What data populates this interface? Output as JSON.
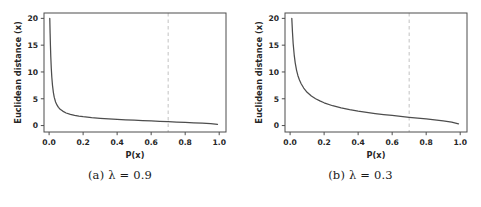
{
  "figure": {
    "panels": [
      {
        "id": "panel-a",
        "caption_index": "(a)",
        "caption_symbol": "λ",
        "caption_value": "= 0.9",
        "caption_full": "(a) λ = 0.9"
      },
      {
        "id": "panel-b",
        "caption_index": "(b)",
        "caption_symbol": "λ",
        "caption_value": "= 0.3",
        "caption_full": "(b) λ = 0.3"
      }
    ]
  },
  "colors": {
    "curve": "#4d4d4d",
    "axis": "#4d4d4d",
    "threshold_line": "#c8c8c8",
    "text": "#262626",
    "background": "#ffffff"
  },
  "chart_data": [
    {
      "type": "line",
      "id": "panel-a",
      "title": "",
      "xlabel": "P(x)",
      "ylabel": "Euclidean distance (x)",
      "xlim": [
        -0.03,
        1.04
      ],
      "ylim": [
        -1.2,
        21.0
      ],
      "xticks": [
        0.0,
        0.2,
        0.4,
        0.6,
        0.8,
        1.0
      ],
      "xticklabels": [
        "0.0",
        "0.2",
        "0.4",
        "0.6",
        "0.8",
        "1.0"
      ],
      "yticks": [
        0,
        5,
        10,
        15,
        20
      ],
      "yticklabels": [
        "0",
        "5",
        "10",
        "15",
        "20"
      ],
      "grid": false,
      "legend": null,
      "annotations": [
        {
          "type": "vline",
          "name": "threshold",
          "x": 0.7,
          "style": "dashed",
          "color": "#c8c8c8"
        }
      ],
      "series": [
        {
          "name": "lambda=0.9",
          "x": [
            0.004,
            0.006,
            0.008,
            0.01,
            0.013,
            0.016,
            0.02,
            0.025,
            0.03,
            0.038,
            0.046,
            0.055,
            0.065,
            0.08,
            0.1,
            0.125,
            0.15,
            0.175,
            0.2,
            0.25,
            0.3,
            0.35,
            0.4,
            0.45,
            0.5,
            0.55,
            0.6,
            0.65,
            0.7,
            0.75,
            0.8,
            0.85,
            0.9,
            0.95,
            0.99
          ],
          "y": [
            20.0,
            17.2,
            14.8,
            12.8,
            10.6,
            9.0,
            7.5,
            6.2,
            5.3,
            4.4,
            3.85,
            3.4,
            3.05,
            2.7,
            2.35,
            2.08,
            1.9,
            1.76,
            1.65,
            1.48,
            1.35,
            1.25,
            1.15,
            1.07,
            1.0,
            0.93,
            0.86,
            0.79,
            0.72,
            0.66,
            0.59,
            0.52,
            0.44,
            0.35,
            0.24
          ]
        }
      ]
    },
    {
      "type": "line",
      "id": "panel-b",
      "title": "",
      "xlabel": "P(x)",
      "ylabel": "Euclidean distance (x)",
      "xlim": [
        -0.03,
        1.04
      ],
      "ylim": [
        -1.2,
        21.0
      ],
      "xticks": [
        0.0,
        0.2,
        0.4,
        0.6,
        0.8,
        1.0
      ],
      "xticklabels": [
        "0.0",
        "0.2",
        "0.4",
        "0.6",
        "0.8",
        "1.0"
      ],
      "yticks": [
        0,
        5,
        10,
        15,
        20
      ],
      "yticklabels": [
        "0",
        "5",
        "10",
        "15",
        "20"
      ],
      "grid": false,
      "legend": null,
      "annotations": [
        {
          "type": "vline",
          "name": "threshold",
          "x": 0.7,
          "style": "dashed",
          "color": "#c8c8c8"
        }
      ],
      "series": [
        {
          "name": "lambda=0.3",
          "x": [
            0.01,
            0.014,
            0.018,
            0.024,
            0.03,
            0.038,
            0.046,
            0.055,
            0.065,
            0.08,
            0.1,
            0.125,
            0.15,
            0.175,
            0.2,
            0.25,
            0.3,
            0.35,
            0.4,
            0.45,
            0.5,
            0.55,
            0.6,
            0.65,
            0.7,
            0.75,
            0.8,
            0.85,
            0.9,
            0.95,
            0.99
          ],
          "y": [
            20.0,
            17.4,
            15.3,
            13.2,
            11.7,
            10.3,
            9.3,
            8.5,
            7.8,
            7.0,
            6.2,
            5.5,
            5.0,
            4.6,
            4.25,
            3.7,
            3.3,
            2.98,
            2.7,
            2.46,
            2.25,
            2.05,
            1.88,
            1.71,
            1.55,
            1.39,
            1.23,
            1.06,
            0.88,
            0.66,
            0.32
          ]
        }
      ]
    }
  ]
}
